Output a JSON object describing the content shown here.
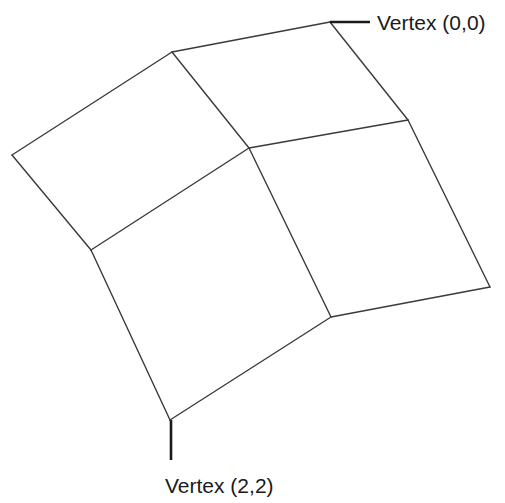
{
  "diagram": {
    "type": "quad-mesh",
    "grid_size": [
      3,
      3
    ],
    "line_color": "#3a3a3a",
    "labels": {
      "top_right": "Vertex (0,0)",
      "bottom": "Vertex (2,2)"
    }
  }
}
